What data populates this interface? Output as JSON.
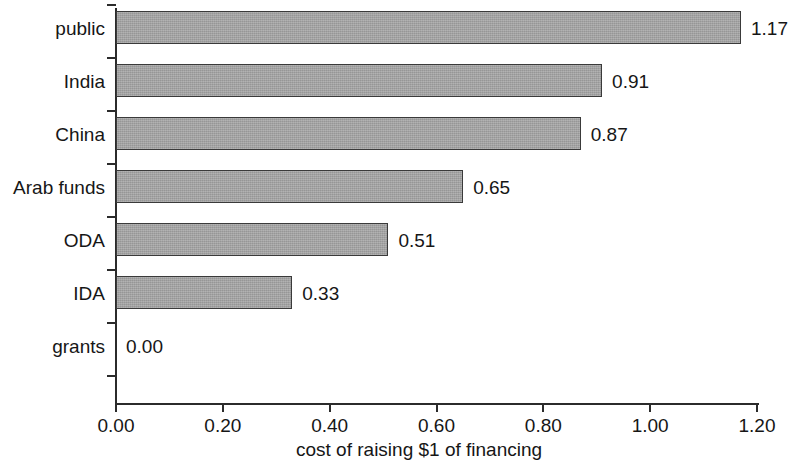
{
  "chart_data": {
    "type": "bar",
    "orientation": "horizontal",
    "title": "",
    "xlabel": "cost of raising $1 of financing",
    "ylabel": "",
    "xlim": [
      0.0,
      1.2
    ],
    "xticks": [
      "0.00",
      "0.20",
      "0.40",
      "0.60",
      "0.80",
      "1.00",
      "1.20"
    ],
    "xtick_values": [
      0.0,
      0.2,
      0.4,
      0.6,
      0.8,
      1.0,
      1.2
    ],
    "grid": false,
    "legend": false,
    "categories": [
      "public",
      "India",
      "China",
      "Arab funds",
      "ODA",
      "IDA",
      "grants"
    ],
    "values": [
      1.17,
      0.91,
      0.87,
      0.65,
      0.51,
      0.33,
      0.0
    ],
    "value_labels": [
      "1.17",
      "0.91",
      "0.87",
      "0.65",
      "0.51",
      "0.33",
      "0.00"
    ],
    "bar_color": "#a3a3a3",
    "bar_border_color": "#3a3a3a",
    "text_color": "#161616",
    "background_color": "#ffffff",
    "bars": [
      {
        "category": "public",
        "value": 1.17,
        "label": "1.17"
      },
      {
        "category": "India",
        "value": 0.91,
        "label": "0.91"
      },
      {
        "category": "China",
        "value": 0.87,
        "label": "0.87"
      },
      {
        "category": "Arab funds",
        "value": 0.65,
        "label": "0.65"
      },
      {
        "category": "ODA",
        "value": 0.51,
        "label": "0.51"
      },
      {
        "category": "IDA",
        "value": 0.33,
        "label": "0.33"
      },
      {
        "category": "grants",
        "value": 0.0,
        "label": "0.00"
      }
    ]
  }
}
